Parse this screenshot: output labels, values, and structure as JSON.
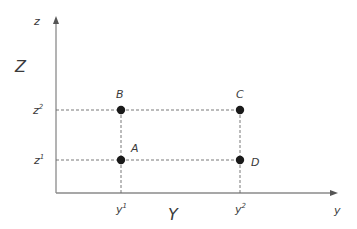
{
  "diagram": {
    "axes": {
      "vertical_label": "z",
      "vertical_title": "Z",
      "horizontal_label": "y",
      "horizontal_title": "Y"
    },
    "ticks": {
      "z1": {
        "base": "z",
        "sup": "1"
      },
      "z2": {
        "base": "z",
        "sup": "2"
      },
      "y1": {
        "base": "y",
        "sup": "1"
      },
      "y2": {
        "base": "y",
        "sup": "2"
      }
    },
    "points": [
      {
        "label": "A",
        "coords": "(y1, z1)"
      },
      {
        "label": "B",
        "coords": "(y1, z2)"
      },
      {
        "label": "C",
        "coords": "(y2, z2)"
      },
      {
        "label": "D",
        "coords": "(y2, z1)"
      }
    ],
    "colors": {
      "axis": "#8a8a8a",
      "dashed": "#6a6a6a",
      "point": "#1a1a1a",
      "text": "#3a3a3a"
    }
  }
}
